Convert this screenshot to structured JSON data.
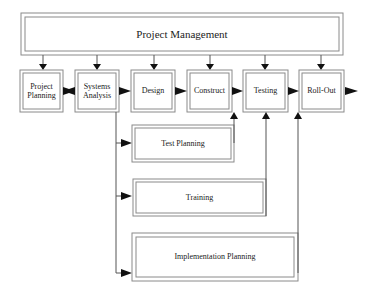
{
  "diagram": {
    "title": "Project Management",
    "phases": [
      {
        "id": "project-planning",
        "label": "Project Planning"
      },
      {
        "id": "systems-analysis",
        "label": "Systems Analysis"
      },
      {
        "id": "design",
        "label": "Design"
      },
      {
        "id": "construct",
        "label": "Construct"
      },
      {
        "id": "testing",
        "label": "Testing"
      },
      {
        "id": "roll-out",
        "label": "Roll-Out"
      }
    ],
    "parallel_tasks": [
      {
        "id": "test-planning",
        "label": "Test Planning",
        "feeds": "Construct"
      },
      {
        "id": "training",
        "label": "Training",
        "feeds": "Testing"
      },
      {
        "id": "implementation-planning",
        "label": "Implementation Planning",
        "feeds": "Roll-Out"
      }
    ],
    "colors": {
      "border": "#8a8a8a",
      "line": "#555555",
      "arrow": "#111111",
      "text": "#222222"
    }
  }
}
